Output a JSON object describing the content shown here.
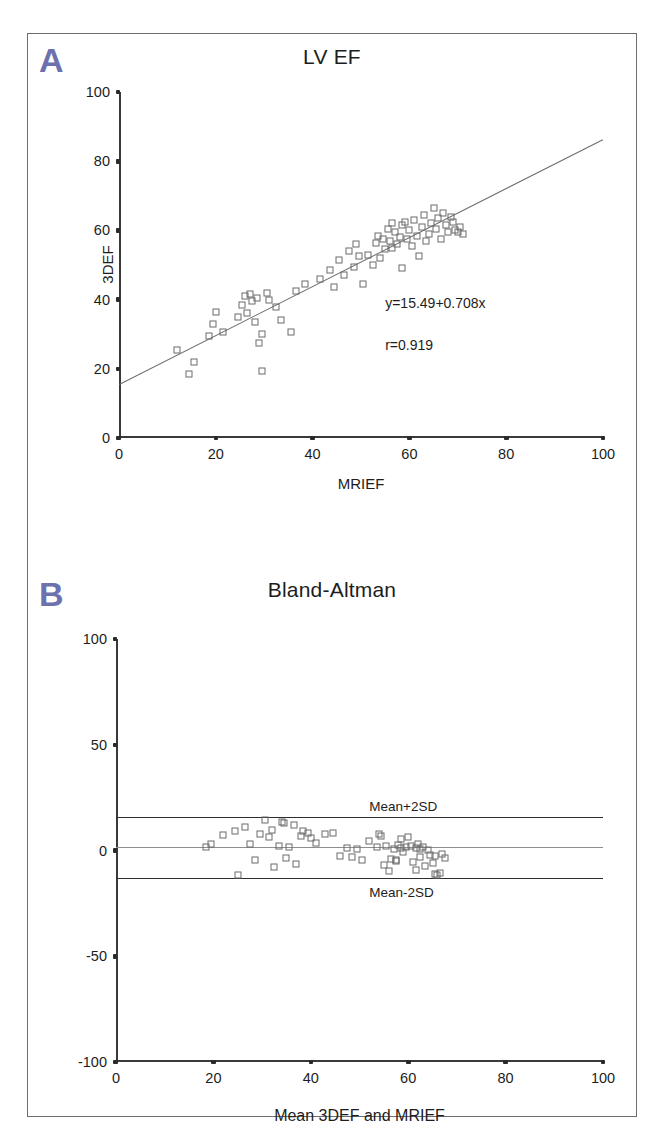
{
  "figure": {
    "panels": [
      {
        "letter": "A",
        "title": "LV EF",
        "xlabel": "MRIEF",
        "ylabel": "3DEF",
        "annotation_eq": "y=15.49+0.708x",
        "annotation_r": "r=0.919"
      },
      {
        "letter": "B",
        "title": "Bland-Altman",
        "xlabel": "Mean 3DEF and MRIEF",
        "label_upper": "Mean+2SD",
        "label_lower": "Mean-2SD"
      }
    ]
  },
  "colors": {
    "panel_letter": "#6d72ae",
    "axis": "#3a3a3a",
    "marker_edge": "#6b6b6b",
    "fit_line": "#6b6b6b",
    "limit_line": "#2e2e2e",
    "mean_line": "#8e8e8e",
    "frame": "#6e6e6e"
  },
  "chart_data": [
    {
      "type": "scatter",
      "panel": "A",
      "title": "LV EF",
      "xlabel": "MRIEF",
      "ylabel": "3DEF",
      "xlim": [
        0,
        100
      ],
      "ylim": [
        0,
        100
      ],
      "xticks": [
        0,
        20,
        40,
        60,
        80,
        100
      ],
      "yticks": [
        0,
        20,
        40,
        60,
        80,
        100
      ],
      "grid": false,
      "legend": "none",
      "regression": {
        "equation": "y=15.49+0.708x",
        "intercept": 15.49,
        "slope": 0.708,
        "r": 0.919,
        "r_label": "r=0.919",
        "line_x": [
          0,
          100
        ],
        "line_y": [
          15.49,
          86.29
        ]
      },
      "points": [
        [
          12.0,
          25.5
        ],
        [
          14.5,
          18.5
        ],
        [
          15.5,
          22.0
        ],
        [
          18.5,
          29.5
        ],
        [
          19.5,
          33.0
        ],
        [
          20.0,
          36.5
        ],
        [
          21.5,
          30.5
        ],
        [
          24.5,
          35.0
        ],
        [
          25.5,
          38.5
        ],
        [
          26.0,
          41.0
        ],
        [
          26.5,
          36.0
        ],
        [
          27.0,
          41.5
        ],
        [
          27.5,
          39.5
        ],
        [
          28.0,
          33.5
        ],
        [
          28.5,
          40.5
        ],
        [
          29.0,
          27.5
        ],
        [
          29.5,
          30.0
        ],
        [
          29.5,
          19.5
        ],
        [
          30.5,
          42.0
        ],
        [
          31.0,
          40.0
        ],
        [
          32.5,
          38.0
        ],
        [
          33.5,
          34.0
        ],
        [
          35.5,
          30.5
        ],
        [
          36.5,
          42.5
        ],
        [
          38.5,
          44.5
        ],
        [
          41.5,
          46.0
        ],
        [
          43.5,
          48.5
        ],
        [
          44.5,
          43.5
        ],
        [
          45.5,
          51.5
        ],
        [
          46.5,
          47.0
        ],
        [
          47.5,
          54.0
        ],
        [
          48.5,
          49.5
        ],
        [
          49.0,
          56.0
        ],
        [
          49.5,
          52.5
        ],
        [
          50.5,
          44.5
        ],
        [
          51.5,
          53.0
        ],
        [
          52.5,
          50.0
        ],
        [
          53.0,
          56.5
        ],
        [
          53.5,
          58.5
        ],
        [
          54.0,
          52.0
        ],
        [
          54.5,
          57.5
        ],
        [
          55.0,
          54.5
        ],
        [
          55.5,
          60.5
        ],
        [
          56.0,
          57.0
        ],
        [
          56.5,
          55.0
        ],
        [
          56.5,
          62.0
        ],
        [
          57.0,
          59.5
        ],
        [
          57.5,
          56.0
        ],
        [
          58.0,
          58.0
        ],
        [
          58.5,
          61.5
        ],
        [
          58.5,
          49.0
        ],
        [
          59.0,
          62.5
        ],
        [
          59.5,
          57.5
        ],
        [
          60.0,
          60.0
        ],
        [
          60.5,
          55.5
        ],
        [
          61.0,
          63.0
        ],
        [
          61.5,
          58.5
        ],
        [
          62.0,
          52.5
        ],
        [
          62.5,
          61.0
        ],
        [
          63.0,
          64.5
        ],
        [
          63.5,
          57.0
        ],
        [
          64.0,
          59.0
        ],
        [
          64.5,
          62.0
        ],
        [
          65.0,
          66.5
        ],
        [
          65.5,
          60.5
        ],
        [
          66.0,
          63.5
        ],
        [
          66.5,
          57.5
        ],
        [
          67.0,
          65.0
        ],
        [
          67.5,
          61.5
        ],
        [
          68.0,
          59.5
        ],
        [
          68.5,
          64.0
        ],
        [
          69.0,
          62.5
        ],
        [
          69.5,
          60.0
        ],
        [
          70.0,
          59.5
        ],
        [
          70.5,
          61.0
        ],
        [
          71.0,
          59.0
        ]
      ]
    },
    {
      "type": "scatter",
      "panel": "B",
      "title": "Bland-Altman",
      "xlabel": "Mean 3DEF and MRIEF",
      "ylabel": "",
      "xlim": [
        0,
        100
      ],
      "ylim": [
        -100,
        100
      ],
      "xticks": [
        0,
        20,
        40,
        60,
        80,
        100
      ],
      "yticks": [
        -100,
        -50,
        0,
        50,
        100
      ],
      "grid": false,
      "legend": "none",
      "reference_lines": [
        {
          "label": "Mean+2SD",
          "y": 16.0
        },
        {
          "label": "Mean",
          "y": 1.5
        },
        {
          "label": "Mean-2SD",
          "y": -13.0
        }
      ],
      "points": [
        [
          18.5,
          1.8
        ],
        [
          19.5,
          3.2
        ],
        [
          22.0,
          7.5
        ],
        [
          24.5,
          9.0
        ],
        [
          25.0,
          -11.5
        ],
        [
          26.5,
          11.0
        ],
        [
          27.5,
          3.0
        ],
        [
          28.5,
          -4.5
        ],
        [
          29.5,
          8.0
        ],
        [
          30.5,
          14.5
        ],
        [
          31.5,
          6.5
        ],
        [
          32.0,
          9.5
        ],
        [
          32.5,
          -8.0
        ],
        [
          33.5,
          2.0
        ],
        [
          34.0,
          13.5
        ],
        [
          34.5,
          13.0
        ],
        [
          35.0,
          -3.5
        ],
        [
          35.5,
          1.5
        ],
        [
          36.5,
          12.0
        ],
        [
          37.0,
          -6.5
        ],
        [
          38.0,
          7.0
        ],
        [
          38.5,
          9.0
        ],
        [
          39.5,
          8.5
        ],
        [
          40.0,
          6.0
        ],
        [
          41.0,
          3.5
        ],
        [
          43.0,
          8.0
        ],
        [
          44.5,
          8.5
        ],
        [
          46.0,
          -2.5
        ],
        [
          47.5,
          1.0
        ],
        [
          48.5,
          -3.0
        ],
        [
          49.5,
          0.5
        ],
        [
          50.5,
          -4.5
        ],
        [
          52.0,
          4.5
        ],
        [
          53.5,
          1.5
        ],
        [
          54.0,
          8.0
        ],
        [
          54.5,
          7.0
        ],
        [
          55.0,
          -7.0
        ],
        [
          55.5,
          2.0
        ],
        [
          56.0,
          -9.5
        ],
        [
          56.5,
          -4.0
        ],
        [
          57.0,
          0.8
        ],
        [
          57.5,
          -5.0
        ],
        [
          57.5,
          -4.5
        ],
        [
          58.0,
          2.5
        ],
        [
          58.5,
          1.0
        ],
        [
          58.5,
          5.5
        ],
        [
          59.0,
          -0.5
        ],
        [
          59.5,
          1.5
        ],
        [
          60.0,
          6.5
        ],
        [
          60.5,
          2.0
        ],
        [
          61.0,
          -5.5
        ],
        [
          61.5,
          1.2
        ],
        [
          61.5,
          -9.0
        ],
        [
          62.0,
          3.0
        ],
        [
          62.5,
          0.5
        ],
        [
          62.5,
          -3.0
        ],
        [
          63.0,
          1.8
        ],
        [
          63.5,
          -7.5
        ],
        [
          64.0,
          0.2
        ],
        [
          64.5,
          -2.0
        ],
        [
          65.0,
          -6.0
        ],
        [
          65.5,
          -2.5
        ],
        [
          65.5,
          -11.0
        ],
        [
          66.0,
          -11.5
        ],
        [
          66.5,
          -10.5
        ],
        [
          67.0,
          -1.5
        ],
        [
          67.5,
          -3.5
        ]
      ]
    }
  ]
}
